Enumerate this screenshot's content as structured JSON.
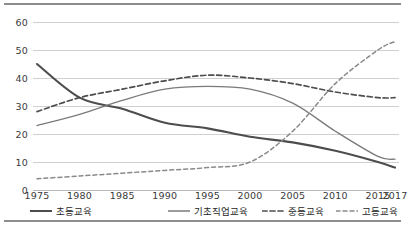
{
  "chart_data": {
    "type": "line",
    "title": "",
    "xlabel": "",
    "ylabel": "",
    "x": [
      1975,
      1980,
      1985,
      1990,
      1995,
      2000,
      2005,
      2010,
      2015,
      2017
    ],
    "categories": [
      "1975",
      "1980",
      "1985",
      "1990",
      "1995",
      "2000",
      "2005",
      "2010",
      "2015",
      "2017"
    ],
    "ylim": [
      0,
      65
    ],
    "yticks": [
      0,
      10,
      20,
      30,
      40,
      50,
      60
    ],
    "ytick_labels": [
      "0",
      "10",
      "20",
      "30",
      "40",
      "50",
      "60"
    ],
    "grid": true,
    "legend_position": "bottom",
    "series": [
      {
        "name": "초등교육",
        "style": "solid-thick",
        "color": "#4d4d4d",
        "values": [
          45,
          33,
          29,
          24,
          22,
          19,
          17,
          14,
          10,
          8
        ]
      },
      {
        "name": "기초직업교육",
        "style": "solid-thin",
        "color": "#7a7a7a",
        "values": [
          23,
          27,
          32,
          36,
          37,
          36,
          31,
          21,
          12,
          11
        ]
      },
      {
        "name": "중등교육",
        "style": "dashed",
        "color": "#4d4d4d",
        "values": [
          28,
          33,
          36,
          39,
          41,
          40,
          38,
          35,
          33,
          33
        ]
      },
      {
        "name": "고등교육",
        "style": "dotted",
        "color": "#8a8a8a",
        "values": [
          4,
          5,
          6,
          7,
          8,
          10,
          21,
          38,
          50,
          53
        ]
      }
    ]
  },
  "legend": {
    "items": [
      {
        "label": "초등교육",
        "style": "solid-thick",
        "color": "#4d4d4d"
      },
      {
        "label": "기초직업교육",
        "style": "solid-thin",
        "color": "#7a7a7a"
      },
      {
        "label": "중등교육",
        "style": "dashed",
        "color": "#4d4d4d"
      },
      {
        "label": "고등교육",
        "style": "dotted",
        "color": "#8a8a8a"
      }
    ]
  }
}
